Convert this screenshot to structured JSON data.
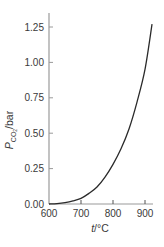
{
  "chart_data": {
    "type": "line",
    "title": "",
    "xlabel": "t/°C",
    "ylabel": "P_CO2/bar",
    "ylabel_parts": {
      "main": "P",
      "sub": "CO",
      "subsub": "2",
      "unit": "/bar"
    },
    "xlabel_parts": {
      "var": "t",
      "unit": "/°C"
    },
    "xlim": [
      600,
      925
    ],
    "ylim": [
      0,
      1.3
    ],
    "x_ticks": [
      600,
      700,
      800,
      900
    ],
    "x_tick_labels": [
      "600",
      "700",
      "800",
      "900"
    ],
    "y_ticks": [
      0,
      0.25,
      0.5,
      0.75,
      1.0,
      1.25
    ],
    "y_tick_labels": [
      "0.00",
      "0.25",
      "0.50",
      "0.75",
      "1.00",
      "1.25"
    ],
    "grid": false,
    "legend": null,
    "series": [
      {
        "name": "CaCO3 decomposition pressure",
        "color": "#2a2a2a",
        "x": [
          600,
          625,
          650,
          675,
          700,
          725,
          750,
          775,
          800,
          825,
          850,
          875,
          900,
          922
        ],
        "values": [
          0.0,
          0.003,
          0.01,
          0.022,
          0.04,
          0.075,
          0.12,
          0.19,
          0.28,
          0.39,
          0.53,
          0.72,
          0.95,
          1.27
        ]
      }
    ]
  },
  "colors": {
    "axis": "#9a9a9a",
    "curve": "#2a2a2a",
    "text": "#3a3a3a"
  }
}
